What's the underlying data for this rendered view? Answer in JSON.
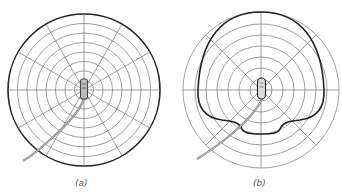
{
  "figures": [
    {
      "id": "a",
      "caption": "(a)",
      "pattern": "omnidirectional",
      "rings": 8,
      "spokes_deg": 30
    },
    {
      "id": "b",
      "caption": "(b)",
      "pattern": "cardioid",
      "rings": 7,
      "spokes_deg": 45
    }
  ],
  "colors": {
    "grid": "#777777",
    "outline": "#222222",
    "cable": "#888888"
  }
}
